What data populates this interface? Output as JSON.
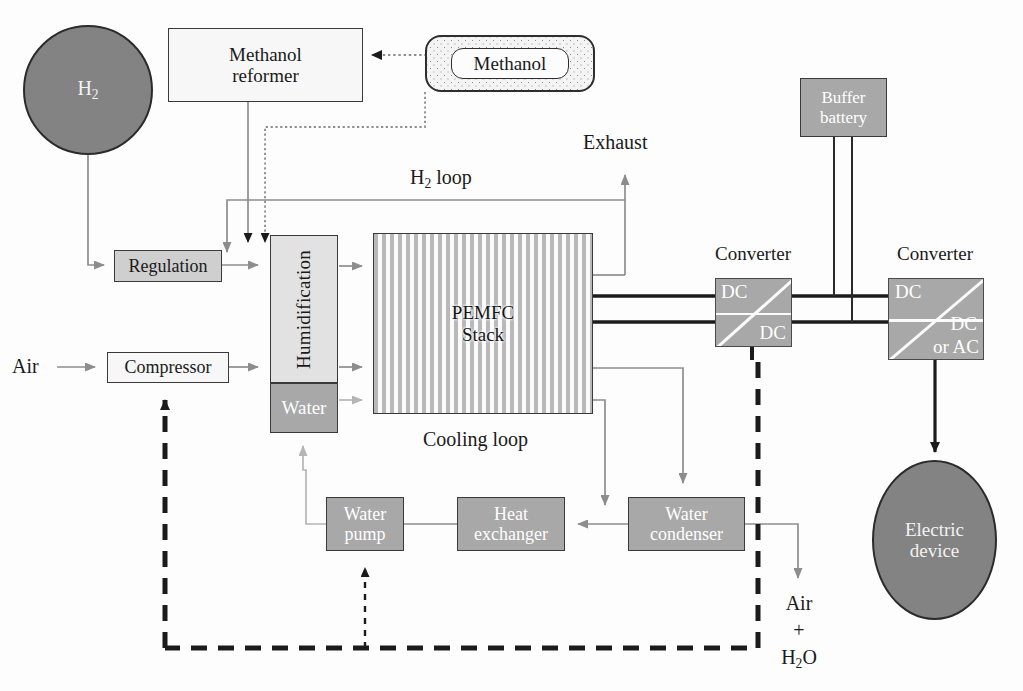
{
  "diagram": {
    "colors": {
      "gray_fill": "#a8a8a8",
      "light_fill": "#cfcfcf",
      "lighter_fill": "#e2e2e2",
      "white_fill": "#f7f7f7",
      "ellipse_fill": "#838383",
      "stripe_dark": "#b9b9b9",
      "stroke": "#3a3a3a",
      "gray_arrow": "#8d8d8d",
      "black_arrow": "#1a1a1a"
    },
    "nodes": {
      "h2_source": {
        "label": "H",
        "sub": "2",
        "shape": "ellipse"
      },
      "methanol_reformer": {
        "line1": "Methanol",
        "line2": "reformer",
        "shape": "rect"
      },
      "methanol_tank": {
        "label": "Methanol",
        "shape": "rounded-tank"
      },
      "regulation": {
        "label": "Regulation",
        "shape": "rect"
      },
      "compressor": {
        "label": "Compressor",
        "shape": "rect"
      },
      "humidification": {
        "label": "Humidification",
        "shape": "rect-vertical-text"
      },
      "water": {
        "label": "Water",
        "shape": "rect"
      },
      "pemfc_stack": {
        "line1": "PEMFC",
        "line2": "Stack",
        "shape": "striped-rect"
      },
      "buffer_battery": {
        "line1": "Buffer",
        "line2": "battery",
        "shape": "rect"
      },
      "converter_dcdc": {
        "title": "Converter",
        "top_label": "DC",
        "bottom_label": "DC"
      },
      "converter_dcac": {
        "title": "Converter",
        "top_label": "DC",
        "bottom_label_1": "DC",
        "bottom_label_2": "or AC"
      },
      "electric_device": {
        "line1": "Electric",
        "line2": "device",
        "shape": "ellipse"
      },
      "water_pump": {
        "line1": "Water",
        "line2": "pump",
        "shape": "rect"
      },
      "heat_exchanger": {
        "line1": "Heat",
        "line2": "exchanger",
        "shape": "rect"
      },
      "water_condenser": {
        "line1": "Water",
        "line2": "condenser",
        "shape": "rect"
      }
    },
    "labels": {
      "air_in": "Air",
      "exhaust": "Exhaust",
      "h2_loop": "H",
      "h2_loop_sub": "2",
      "h2_loop_rest": " loop",
      "cooling_loop": "Cooling loop",
      "air_out_line1": "Air",
      "air_out_line2": "+",
      "air_out_line3_a": "H",
      "air_out_line3_sub": "2",
      "air_out_line3_b": "O"
    }
  }
}
